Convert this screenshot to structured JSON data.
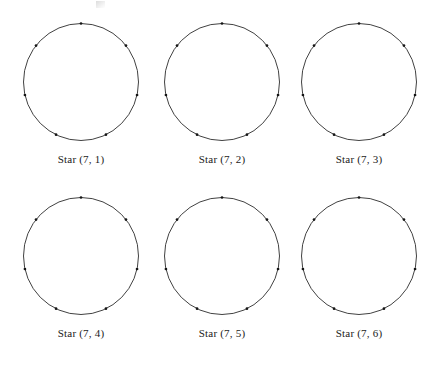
{
  "figure": {
    "name": "star-polygon-circle-grid",
    "background_color": "#ffffff",
    "stroke_color": "#2b2b2b",
    "vertex_color": "#151515",
    "text_color": "#1a1a1a",
    "columns": 3,
    "rows": 2,
    "vertex_count": 7,
    "top_artifact": {
      "present": true,
      "description": "faint smudge mark near top edge"
    },
    "cells": [
      {
        "id": "star-7-1",
        "label": "Star (7, 1)",
        "n": 7,
        "k": 1,
        "vertices": 7,
        "chords_drawn": false,
        "column": 0,
        "row": 0
      },
      {
        "id": "star-7-2",
        "label": "Star (7, 2)",
        "n": 7,
        "k": 2,
        "vertices": 7,
        "chords_drawn": false,
        "column": 1,
        "row": 0
      },
      {
        "id": "star-7-3",
        "label": "Star (7, 3)",
        "n": 7,
        "k": 3,
        "vertices": 7,
        "chords_drawn": false,
        "column": 2,
        "row": 0
      },
      {
        "id": "star-7-4",
        "label": "Star (7, 4)",
        "n": 7,
        "k": 4,
        "vertices": 7,
        "chords_drawn": false,
        "column": 0,
        "row": 1
      },
      {
        "id": "star-7-5",
        "label": "Star (7, 5)",
        "n": 7,
        "k": 5,
        "vertices": 7,
        "chords_drawn": false,
        "column": 1,
        "row": 1
      },
      {
        "id": "star-7-6",
        "label": "Star (7, 6)",
        "n": 7,
        "k": 6,
        "vertices": 7,
        "chords_drawn": false,
        "column": 2,
        "row": 1
      }
    ]
  }
}
